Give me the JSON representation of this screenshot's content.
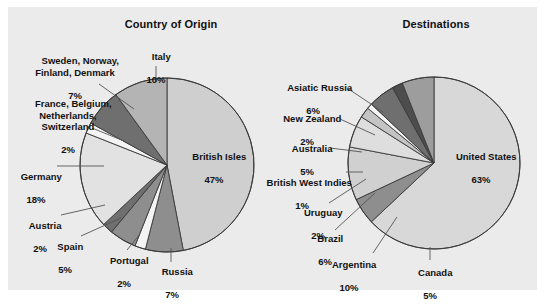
{
  "figure": {
    "background": "#ebebeb",
    "page_background": "#ffffff"
  },
  "charts": [
    {
      "id": "country-of-origin",
      "title": "Country of Origin",
      "center": [
        167,
        165
      ],
      "radius": 87
    },
    {
      "id": "destinations",
      "title": "Destinations",
      "center": [
        434,
        163
      ],
      "radius": 86
    }
  ],
  "labels": {
    "origin": {
      "british_isles": {
        "name": "British Isles",
        "pct": "47%"
      },
      "italy": {
        "name": "Italy",
        "pct": "10%"
      },
      "sweden": {
        "name": "Sweden, Norway,\nFinland, Denmark",
        "pct": "7%"
      },
      "france": {
        "name": "France, Belgium,\nNetherlands,\nSwitzerland",
        "pct": "2%"
      },
      "germany": {
        "name": "Germany",
        "pct": "18%"
      },
      "austria": {
        "name": "Austria",
        "pct": "2%"
      },
      "spain": {
        "name": "Spain",
        "pct": "5%"
      },
      "portugal": {
        "name": "Portugal",
        "pct": "2%"
      },
      "russia": {
        "name": "Russia",
        "pct": "7%"
      }
    },
    "destinations": {
      "united_states": {
        "name": "United States",
        "pct": "63%"
      },
      "asiatic_russia": {
        "name": "Asiatic Russia",
        "pct": "6%"
      },
      "new_zealand": {
        "name": "New Zealand",
        "pct": "2%"
      },
      "australia": {
        "name": "Australia",
        "pct": "5%"
      },
      "british_west_indies": {
        "name": "British West Indies",
        "pct": "1%"
      },
      "uruguay": {
        "name": "Uruguay",
        "pct": "2%"
      },
      "brazil": {
        "name": "Brazil",
        "pct": "6%"
      },
      "argentina": {
        "name": "Argentina",
        "pct": "10%"
      },
      "canada": {
        "name": "Canada",
        "pct": "5%"
      }
    }
  },
  "chart_data": [
    {
      "type": "pie",
      "title": "Country of Origin",
      "categories": [
        "British Isles",
        "Russia",
        "Portugal",
        "Spain",
        "Austria",
        "Germany",
        "France, Belgium, Netherlands, Switzerland",
        "Sweden, Norway, Finland, Denmark",
        "Italy"
      ],
      "values": [
        47,
        7,
        2,
        5,
        2,
        18,
        2,
        7,
        10
      ],
      "units": "percent",
      "start_angle_deg": 0,
      "direction": "clockwise",
      "colors": [
        "#cfcfcf",
        "#8e8e8e",
        "#f4f4f4",
        "#8e8e8e",
        "#6f6f6f",
        "#e2e2e2",
        "#f4f4f4",
        "#6f6f6f",
        "#b4b4b4"
      ],
      "slice_labels": [
        "British Isles 47%",
        "Russia 7%",
        "Portugal 2%",
        "Spain 5%",
        "Austria 2%",
        "Germany 18%",
        "France, Belgium, Netherlands, Switzerland 2%",
        "Sweden, Norway, Finland, Denmark 7%",
        "Italy 10%"
      ],
      "legend": "none",
      "grid": false
    },
    {
      "type": "pie",
      "title": "Destinations",
      "categories": [
        "United States",
        "Canada",
        "Argentina",
        "Brazil",
        "Uruguay",
        "British West Indies",
        "Australia",
        "New Zealand",
        "Asiatic Russia"
      ],
      "values": [
        63,
        5,
        10,
        6,
        2,
        1,
        5,
        2,
        6
      ],
      "units": "percent",
      "start_angle_deg": 0,
      "direction": "clockwise",
      "colors": [
        "#d8d8d8",
        "#8e8e8e",
        "#d0d0d0",
        "#dedede",
        "#c4c4c4",
        "#f4f4f4",
        "#6f6f6f",
        "#4d4d4d",
        "#9d9d9d"
      ],
      "slice_labels": [
        "United States 63%",
        "Canada 5%",
        "Argentina 10%",
        "Brazil 6%",
        "Uruguay 2%",
        "British West Indies 1%",
        "Australia 5%",
        "New Zealand 2%",
        "Asiatic Russia 6%"
      ],
      "legend": "none",
      "grid": false
    }
  ]
}
